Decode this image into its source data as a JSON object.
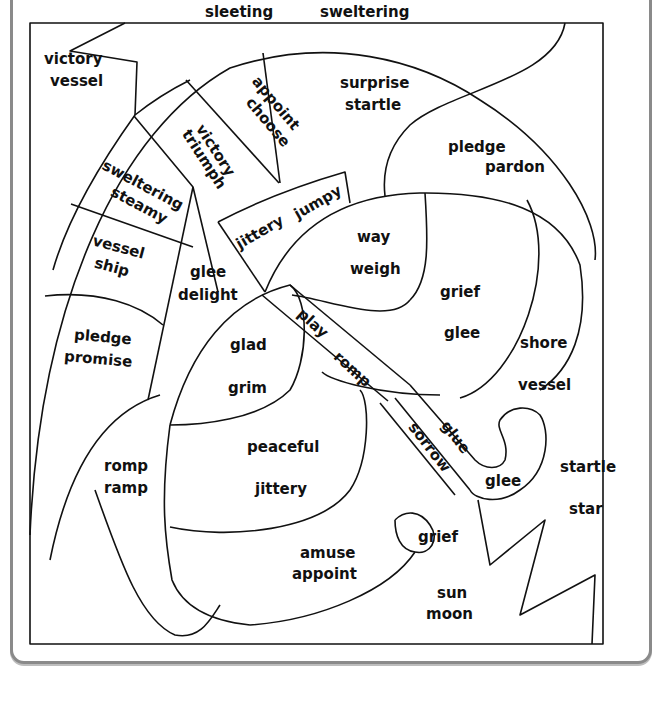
{
  "worksheet": {
    "title": "Synonym / homophone coloring puzzle",
    "regions": [
      {
        "id": "top-sleeting",
        "words": [
          "sleeting"
        ]
      },
      {
        "id": "top-sweltering",
        "words": [
          "sweltering"
        ]
      },
      {
        "id": "sky-left",
        "words": [
          "victory",
          "vessel"
        ]
      },
      {
        "id": "panel-appoint",
        "words": [
          "appoint",
          "choose"
        ]
      },
      {
        "id": "panel-surprise",
        "words": [
          "surprise",
          "startle"
        ]
      },
      {
        "id": "panel-victory",
        "words": [
          "victory",
          "triumph"
        ]
      },
      {
        "id": "panel-sweltering",
        "words": [
          "sweltering",
          "steamy"
        ]
      },
      {
        "id": "panel-pledge-pardon",
        "words": [
          "pledge",
          "pardon"
        ]
      },
      {
        "id": "panel-jittery",
        "words": [
          "jittery",
          "jumpy"
        ]
      },
      {
        "id": "panel-vessel",
        "words": [
          "vessel",
          "ship"
        ]
      },
      {
        "id": "leaf-way",
        "words": [
          "way",
          "weigh"
        ]
      },
      {
        "id": "panel-glee",
        "words": [
          "glee",
          "delight"
        ]
      },
      {
        "id": "leaf-grief",
        "words": [
          "grief",
          "glee"
        ]
      },
      {
        "id": "panel-pledge-promise",
        "words": [
          "pledge",
          "promise"
        ]
      },
      {
        "id": "handle-play",
        "words": [
          "play"
        ]
      },
      {
        "id": "leaf-glad",
        "words": [
          "glad",
          "grim"
        ]
      },
      {
        "id": "leaf-shore",
        "words": [
          "shore",
          "vessel"
        ]
      },
      {
        "id": "handle-romp",
        "words": [
          "romp"
        ]
      },
      {
        "id": "lower-peaceful",
        "words": [
          "peaceful",
          "jittery"
        ]
      },
      {
        "id": "lower-romp-ramp",
        "words": [
          "romp",
          "ramp"
        ]
      },
      {
        "id": "handle-sorrow",
        "words": [
          "sorrow"
        ]
      },
      {
        "id": "handle-glue",
        "words": [
          "glue"
        ]
      },
      {
        "id": "hook-glee",
        "words": [
          "glee"
        ]
      },
      {
        "id": "right-startle",
        "words": [
          "startle",
          "star"
        ]
      },
      {
        "id": "hook-grief",
        "words": [
          "grief"
        ]
      },
      {
        "id": "lower-amuse",
        "words": [
          "amuse",
          "appoint"
        ]
      },
      {
        "id": "bottom-sun",
        "words": [
          "sun",
          "moon"
        ]
      }
    ],
    "labels": {
      "sleeting": "sleeting",
      "sweltering": "sweltering",
      "victory1": "victory",
      "vessel1": "vessel",
      "appoint1": "appoint",
      "choose": "choose",
      "surprise": "surprise",
      "startle1": "startle",
      "victory2": "victory",
      "triumph": "triumph",
      "sweltering2": "sweltering",
      "steamy": "steamy",
      "pledge1": "pledge",
      "pardon": "pardon",
      "jittery1": "jittery",
      "jumpy": "jumpy",
      "vessel2": "vessel",
      "ship": "ship",
      "way": "way",
      "weigh": "weigh",
      "glee1": "glee",
      "delight": "delight",
      "grief1": "grief",
      "glee2": "glee",
      "pledge2": "pledge",
      "promise": "promise",
      "play": "play",
      "glad": "glad",
      "grim": "grim",
      "shore": "shore",
      "vessel3": "vessel",
      "romp1": "romp",
      "peaceful": "peaceful",
      "jittery2": "jittery",
      "romp2": "romp",
      "ramp": "ramp",
      "sorrow": "sorrow",
      "glue": "glue",
      "glee3": "glee",
      "startle2": "startle",
      "star": "star",
      "grief2": "grief",
      "amuse": "amuse",
      "appoint2": "appoint",
      "sun": "sun",
      "moon": "moon"
    }
  },
  "colors": {
    "line": "#111111",
    "frame": "#8a8a8a",
    "paper": "#ffffff"
  }
}
